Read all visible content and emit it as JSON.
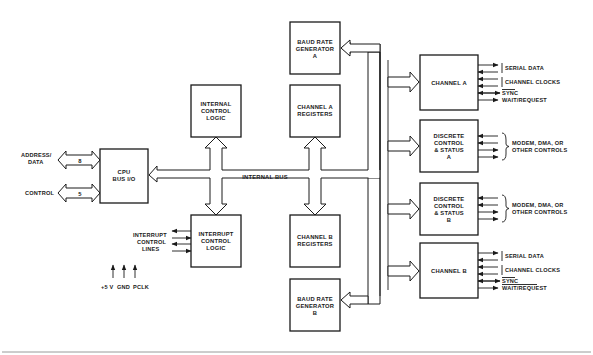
{
  "diagram": {
    "colors": {
      "line": "#1a1a1a",
      "background": "#ffffff",
      "footer_rule": "#9a9a9a"
    },
    "cpu_interface": {
      "address_data_label": "ADDRESS/",
      "address_data_label2": "DATA",
      "address_data_width": "8",
      "control_label": "CONTROL",
      "control_width": "5"
    },
    "blocks": {
      "cpu_bus_io": [
        "CPU",
        "BUS I/O"
      ],
      "internal_control_logic": [
        "INTERNAL",
        "CONTROL",
        "LOGIC"
      ],
      "interrupt_control_logic": [
        "INTERRUPT",
        "CONTROL",
        "LOGIC"
      ],
      "baud_rate_generator_a": [
        "BAUD RATE",
        "GENERATOR",
        "A"
      ],
      "channel_a_registers": [
        "CHANNEL A",
        "REGISTERS"
      ],
      "channel_b_registers": [
        "CHANNEL B",
        "REGISTERS"
      ],
      "baud_rate_generator_b": [
        "BAUD RATE",
        "GENERATOR",
        "B"
      ],
      "channel_a": [
        "CHANNEL A"
      ],
      "discrete_control_status_a": [
        "DISCRETE",
        "CONTROL",
        "& STATUS",
        "A"
      ],
      "discrete_control_status_b": [
        "DISCRETE",
        "CONTROL",
        "& STATUS",
        "B"
      ],
      "channel_b": [
        "CHANNEL B"
      ]
    },
    "internal_bus_label": "INTERNAL BUS",
    "interrupt_lines_label": [
      "INTERRUPT",
      "CONTROL",
      "LINES"
    ],
    "power_pins": [
      "+5 V",
      "GND",
      "PCLK"
    ],
    "channel_a_signals": {
      "serial_data": "SERIAL DATA",
      "channel_clocks": "CHANNEL CLOCKS",
      "sync": "SYNC",
      "wait_request": "WAIT/REQUEST"
    },
    "discrete_a_signals": [
      "MODEM, DMA, OR",
      "OTHER CONTROLS"
    ],
    "discrete_b_signals": [
      "MODEM, DMA, OR",
      "OTHER CONTROLS"
    ],
    "channel_b_signals": {
      "serial_data": "SERIAL DATA",
      "channel_clocks": "CHANNEL CLOCKS",
      "sync": "SYNC",
      "wait_request": "WAIT/REQUEST"
    }
  }
}
